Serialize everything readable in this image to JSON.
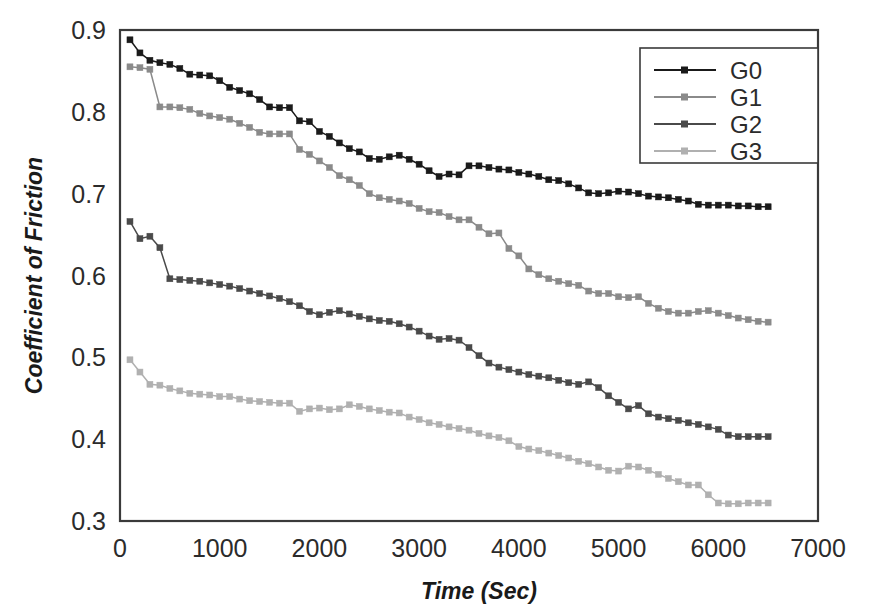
{
  "chart_data": {
    "type": "line",
    "title": "",
    "xlabel": "Time (Sec)",
    "ylabel": "Coefficient of Friction",
    "xlim": [
      0,
      7000
    ],
    "ylim": [
      0.3,
      0.9
    ],
    "xticks": [
      0,
      1000,
      2000,
      3000,
      4000,
      5000,
      6000,
      7000
    ],
    "yticks": [
      0.3,
      0.4,
      0.5,
      0.6,
      0.7,
      0.8,
      0.9
    ],
    "xtick_labels": [
      "0",
      "1000",
      "2000",
      "3000",
      "4000",
      "5000",
      "6000",
      "7000"
    ],
    "ytick_labels": [
      "0.3",
      "0.4",
      "0.5",
      "0.6",
      "0.7",
      "0.8",
      "0.9"
    ],
    "grid": false,
    "legend_position": "top-right",
    "marker": "square",
    "x": [
      100,
      200,
      300,
      400,
      500,
      600,
      700,
      800,
      900,
      1000,
      1100,
      1200,
      1300,
      1400,
      1500,
      1600,
      1700,
      1800,
      1900,
      2000,
      2100,
      2200,
      2300,
      2400,
      2500,
      2600,
      2700,
      2800,
      2900,
      3000,
      3100,
      3200,
      3300,
      3400,
      3500,
      3600,
      3700,
      3800,
      3900,
      4000,
      4100,
      4200,
      4300,
      4400,
      4500,
      4600,
      4700,
      4800,
      4900,
      5000,
      5100,
      5200,
      5300,
      5400,
      5500,
      5600,
      5700,
      5800,
      5900,
      6000,
      6100,
      6200,
      6300,
      6400,
      6500
    ],
    "series": [
      {
        "name": "G0",
        "color": "#1a1a1a",
        "values": [
          0.888,
          0.872,
          0.863,
          0.86,
          0.858,
          0.853,
          0.846,
          0.845,
          0.844,
          0.838,
          0.83,
          0.826,
          0.822,
          0.815,
          0.806,
          0.805,
          0.805,
          0.789,
          0.788,
          0.776,
          0.77,
          0.762,
          0.755,
          0.751,
          0.743,
          0.742,
          0.745,
          0.747,
          0.742,
          0.736,
          0.728,
          0.721,
          0.724,
          0.723,
          0.734,
          0.734,
          0.732,
          0.73,
          0.729,
          0.726,
          0.724,
          0.721,
          0.717,
          0.716,
          0.712,
          0.707,
          0.701,
          0.7,
          0.701,
          0.703,
          0.702,
          0.7,
          0.697,
          0.696,
          0.695,
          0.693,
          0.691,
          0.687,
          0.686,
          0.686,
          0.686,
          0.685,
          0.685,
          0.684,
          0.684
        ]
      },
      {
        "name": "G1",
        "color": "#8a8a8a",
        "values": [
          0.855,
          0.854,
          0.852,
          0.806,
          0.806,
          0.805,
          0.803,
          0.798,
          0.795,
          0.793,
          0.791,
          0.786,
          0.781,
          0.775,
          0.773,
          0.773,
          0.773,
          0.754,
          0.748,
          0.74,
          0.732,
          0.722,
          0.717,
          0.71,
          0.7,
          0.695,
          0.693,
          0.691,
          0.688,
          0.682,
          0.678,
          0.677,
          0.672,
          0.668,
          0.668,
          0.659,
          0.651,
          0.652,
          0.633,
          0.624,
          0.608,
          0.601,
          0.596,
          0.593,
          0.59,
          0.588,
          0.581,
          0.578,
          0.578,
          0.574,
          0.573,
          0.574,
          0.566,
          0.56,
          0.556,
          0.554,
          0.554,
          0.556,
          0.557,
          0.554,
          0.551,
          0.548,
          0.546,
          0.544,
          0.543
        ]
      },
      {
        "name": "G2",
        "color": "#4a4a4a",
        "values": [
          0.666,
          0.645,
          0.648,
          0.634,
          0.596,
          0.595,
          0.594,
          0.593,
          0.591,
          0.589,
          0.587,
          0.584,
          0.581,
          0.578,
          0.575,
          0.572,
          0.568,
          0.563,
          0.556,
          0.552,
          0.555,
          0.557,
          0.553,
          0.55,
          0.547,
          0.545,
          0.544,
          0.541,
          0.537,
          0.532,
          0.526,
          0.522,
          0.523,
          0.521,
          0.512,
          0.502,
          0.493,
          0.488,
          0.485,
          0.482,
          0.479,
          0.477,
          0.475,
          0.472,
          0.469,
          0.467,
          0.47,
          0.463,
          0.453,
          0.445,
          0.437,
          0.441,
          0.431,
          0.427,
          0.425,
          0.423,
          0.42,
          0.418,
          0.415,
          0.412,
          0.405,
          0.403,
          0.403,
          0.403,
          0.403
        ]
      },
      {
        "name": "G3",
        "color": "#b0b0b0",
        "values": [
          0.497,
          0.482,
          0.467,
          0.466,
          0.462,
          0.459,
          0.456,
          0.455,
          0.454,
          0.452,
          0.452,
          0.449,
          0.447,
          0.446,
          0.445,
          0.444,
          0.444,
          0.434,
          0.437,
          0.438,
          0.436,
          0.437,
          0.442,
          0.44,
          0.437,
          0.435,
          0.433,
          0.432,
          0.427,
          0.424,
          0.42,
          0.418,
          0.415,
          0.413,
          0.411,
          0.407,
          0.404,
          0.402,
          0.398,
          0.391,
          0.388,
          0.386,
          0.383,
          0.38,
          0.377,
          0.373,
          0.37,
          0.366,
          0.362,
          0.361,
          0.367,
          0.366,
          0.362,
          0.357,
          0.352,
          0.348,
          0.344,
          0.344,
          0.332,
          0.322,
          0.321,
          0.321,
          0.322,
          0.322,
          0.322
        ]
      }
    ]
  },
  "legend": {
    "entries": [
      {
        "label": "G0"
      },
      {
        "label": "G1"
      },
      {
        "label": "G2"
      },
      {
        "label": "G3"
      }
    ]
  },
  "axes": {
    "y_title": "Coefficient of Friction",
    "x_title": "Time (Sec)"
  }
}
